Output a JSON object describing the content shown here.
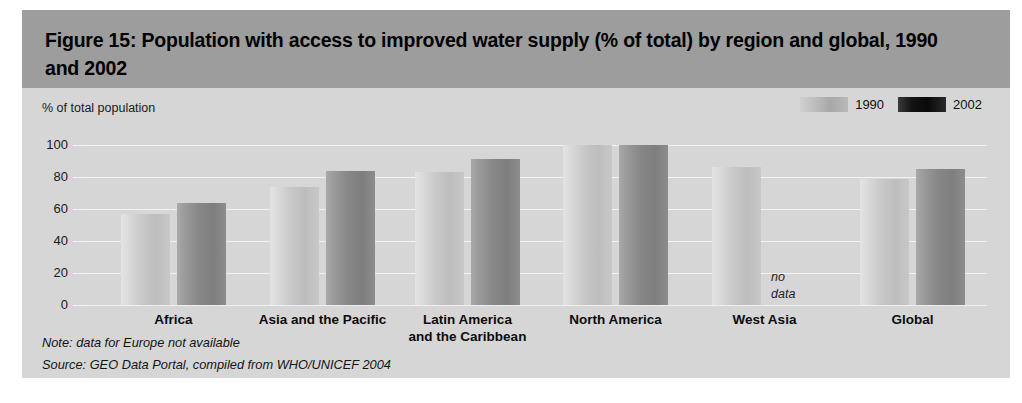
{
  "figure": {
    "title": "Figure 15: Population with access to improved water supply (% of total) by region and global, 1990 and 2002",
    "axis_title": "% of total population",
    "note": "Note: data for Europe not available",
    "source": "Source:  GEO Data Portal, compiled from WHO/UNICEF 2004",
    "no_data_line1": "no",
    "no_data_line2": "data"
  },
  "colors": {
    "header_band": "#9d9d9d",
    "body_background": "#d6d6d6",
    "series_1990": "#c9c9c9",
    "series_2002": "#878787",
    "legend_1990": "#b8b8b8",
    "legend_2002": "#0a0a0a",
    "gridline": "#f2f2f2"
  },
  "legend": {
    "items": [
      {
        "label": "1990",
        "swatch": "series-1990-swatch"
      },
      {
        "label": "2002",
        "swatch": "series-2002-swatch"
      }
    ]
  },
  "chart_data": {
    "type": "bar",
    "title": "Figure 15: Population with access to improved water supply (% of total) by region and global, 1990 and 2002",
    "xlabel": "",
    "ylabel": "% of total population",
    "ylim": [
      0,
      100
    ],
    "yticks": [
      0,
      20,
      40,
      60,
      80,
      100
    ],
    "ytick_labels": [
      "0",
      "20",
      "40",
      "60",
      "80",
      "100"
    ],
    "grid": true,
    "legend_position": "top-right",
    "categories": [
      "Africa",
      "Asia and the Pacific",
      "Latin America and the Caribbean",
      "North America",
      "West Asia",
      "Global"
    ],
    "category_lines": [
      [
        "Africa"
      ],
      [
        "Asia and the Pacific"
      ],
      [
        "Latin America",
        "and the Caribbean"
      ],
      [
        "North America"
      ],
      [
        "West Asia"
      ],
      [
        "Global"
      ]
    ],
    "series": [
      {
        "name": "1990",
        "values": [
          57,
          74,
          83,
          100,
          86,
          79
        ]
      },
      {
        "name": "2002",
        "values": [
          64,
          84,
          91,
          100,
          null,
          85
        ]
      }
    ],
    "annotations": [
      {
        "category": "West Asia",
        "series": "2002",
        "text": "no data"
      }
    ],
    "notes": [
      "Note: data for Europe not available",
      "Source:  GEO Data Portal, compiled from WHO/UNICEF 2004"
    ]
  }
}
